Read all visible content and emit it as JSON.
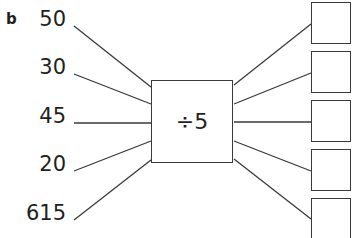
{
  "part_label": "b",
  "operation": "÷5",
  "inputs": [
    "50",
    "30",
    "45",
    "20",
    "615"
  ],
  "outputs": [
    "",
    "",
    "",
    "",
    ""
  ],
  "colors": {
    "line": "#3a3a3a",
    "text": "#231f20"
  }
}
